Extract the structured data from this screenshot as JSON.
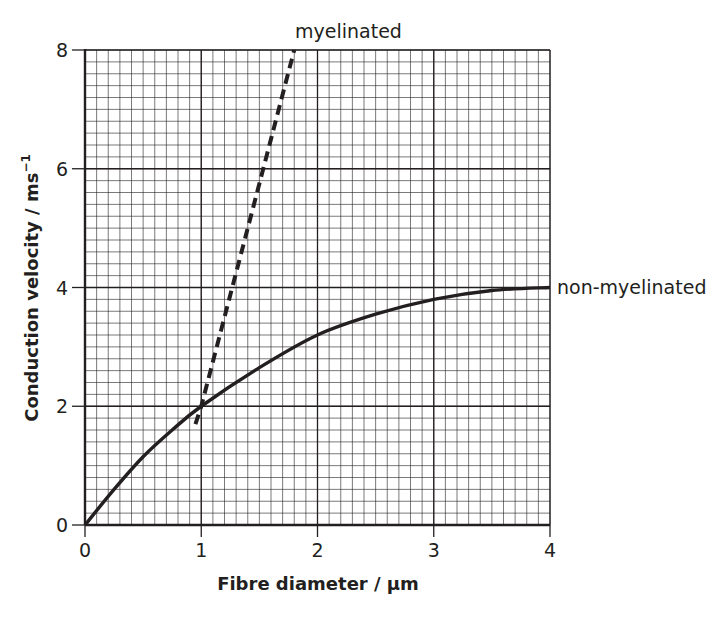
{
  "chart_data": {
    "type": "line",
    "title": "",
    "xlabel": "Fibre diameter / µm",
    "ylabel": "Conduction velocity / ms",
    "ylabel_superscript": "−1",
    "xlim": [
      0,
      4
    ],
    "ylim": [
      0,
      8
    ],
    "x_ticks": [
      "0",
      "1",
      "2",
      "3",
      "4"
    ],
    "y_ticks": [
      "0",
      "2",
      "4",
      "6",
      "8"
    ],
    "grid": true,
    "grid_minor_x": 0.1,
    "grid_minor_y": 0.2,
    "legend_position": "direct labels",
    "series": [
      {
        "name": "non-myelinated",
        "style": "solid",
        "x": [
          0,
          0.25,
          0.5,
          0.75,
          1.0,
          1.5,
          2.0,
          2.5,
          3.0,
          3.5,
          4.0
        ],
        "values": [
          0,
          0.6,
          1.15,
          1.6,
          2.0,
          2.65,
          3.2,
          3.55,
          3.8,
          3.95,
          4.0
        ]
      },
      {
        "name": "myelinated",
        "style": "dashed",
        "x": [
          0.95,
          1.0,
          1.8
        ],
        "values": [
          1.7,
          2.0,
          8.0
        ]
      }
    ],
    "annotations": [
      {
        "text": "myelinated",
        "position": "top, above end of dashed line"
      },
      {
        "text": "non-myelinated",
        "position": "right of plot at y=4"
      }
    ]
  },
  "colors": {
    "line": "#231f20",
    "grid": "#231f20",
    "background": "#ffffff"
  }
}
